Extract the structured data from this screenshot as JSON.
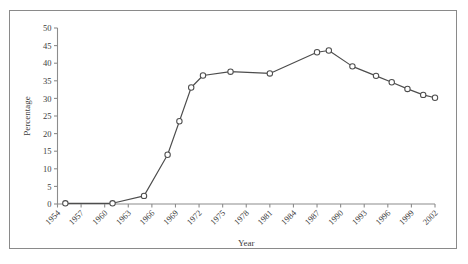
{
  "figure": {
    "background_color": "#ffffff",
    "frame_color": "#8a8a8a",
    "axis_color": "#8c8c8c",
    "line_color": "#4d4d4d",
    "marker_fill": "#ffffff",
    "marker_edge": "#4d4d4d"
  },
  "chart_data": {
    "type": "line",
    "title": "",
    "xlabel": "Year",
    "ylabel": "Percentage",
    "xlim": [
      1954,
      2002
    ],
    "ylim": [
      0,
      50
    ],
    "grid": false,
    "legend": "none",
    "xticks": [
      1954,
      1957,
      1960,
      1963,
      1966,
      1969,
      1972,
      1975,
      1978,
      1981,
      1984,
      1987,
      1990,
      1993,
      1996,
      1999,
      2002
    ],
    "xtick_labels": [
      "1954",
      "1957",
      "1960",
      "1963",
      "1966",
      "1969",
      "1972",
      "1975",
      "1978",
      "1981",
      "1984",
      "1987",
      "1990",
      "1993",
      "1996",
      "1999",
      "2002"
    ],
    "yticks": [
      0,
      5,
      10,
      15,
      20,
      25,
      30,
      35,
      40,
      45,
      50
    ],
    "ytick_labels": [
      "0",
      "5",
      "10",
      "15",
      "20",
      "25",
      "30",
      "35",
      "40",
      "45",
      "50"
    ],
    "x": [
      1955,
      1961,
      1965,
      1968,
      1969.5,
      1971,
      1972.5,
      1976,
      1981,
      1987,
      1988.5,
      1991.5,
      1994.5,
      1996.5,
      1998.5,
      2000.5,
      2002
    ],
    "values": [
      0.2,
      0.2,
      2.3,
      14.0,
      23.5,
      33.1,
      36.5,
      37.6,
      37.1,
      43.1,
      43.6,
      39.1,
      36.4,
      34.6,
      32.7,
      31.0,
      30.2
    ],
    "series": [
      {
        "name": "Percentage",
        "marker": "open-circle",
        "points": [
          {
            "x": 1955,
            "y": 0.2
          },
          {
            "x": 1961,
            "y": 0.2
          },
          {
            "x": 1965,
            "y": 2.3
          },
          {
            "x": 1968,
            "y": 14.0
          },
          {
            "x": 1969.5,
            "y": 23.5
          },
          {
            "x": 1971,
            "y": 33.1
          },
          {
            "x": 1972.5,
            "y": 36.5
          },
          {
            "x": 1976,
            "y": 37.6
          },
          {
            "x": 1981,
            "y": 37.1
          },
          {
            "x": 1987,
            "y": 43.1
          },
          {
            "x": 1988.5,
            "y": 43.6
          },
          {
            "x": 1991.5,
            "y": 39.1
          },
          {
            "x": 1994.5,
            "y": 36.4
          },
          {
            "x": 1996.5,
            "y": 34.6
          },
          {
            "x": 1998.5,
            "y": 32.7
          },
          {
            "x": 2000.5,
            "y": 31.0
          },
          {
            "x": 2002,
            "y": 30.2
          }
        ]
      }
    ]
  }
}
